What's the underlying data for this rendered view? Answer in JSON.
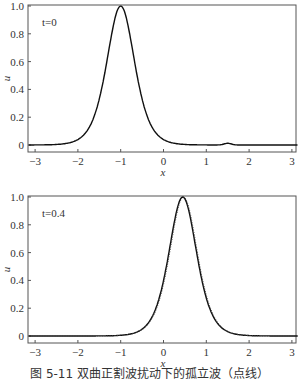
{
  "caption": "图 5-11   双曲正割波扰动下的孤立波（点线）",
  "chart_data": [
    {
      "type": "line",
      "annotation": "t=0",
      "xlabel": "x",
      "ylabel": "u",
      "xlim": [
        -3.15,
        3.15
      ],
      "ylim": [
        -0.03,
        1.0
      ],
      "xticks": [
        "-3",
        "-2",
        "-1",
        "0",
        "1",
        "2",
        "3"
      ],
      "yticks": [
        "0",
        "0.2",
        "0.4",
        "0.6",
        "0.8",
        "1.0"
      ],
      "grid": false,
      "series": [
        {
          "name": "solitary wave",
          "style": "solid",
          "peak_x": -1.0,
          "peak_u": 1.0,
          "x": [
            -3,
            -2.5,
            -2,
            -1.75,
            -1.5,
            -1.25,
            -1,
            -0.75,
            -0.5,
            -0.25,
            0,
            0.5,
            1,
            1.5,
            2,
            3
          ],
          "values": [
            0,
            0.003,
            0.02,
            0.07,
            0.25,
            0.63,
            1.0,
            0.63,
            0.25,
            0.07,
            0.02,
            0.003,
            0,
            0.01,
            0,
            0
          ]
        }
      ]
    },
    {
      "type": "line",
      "annotation": "t=0.4",
      "xlabel": "x",
      "ylabel": "u",
      "xlim": [
        -3.15,
        3.15
      ],
      "ylim": [
        -0.03,
        1.0
      ],
      "xticks": [
        "-3",
        "-2",
        "-1",
        "0",
        "1",
        "2",
        "3"
      ],
      "yticks": [
        "0",
        "0.2",
        "0.4",
        "0.6",
        "0.8",
        "1.0"
      ],
      "grid": false,
      "series": [
        {
          "name": "perturbed solitary wave (dotted)",
          "style": "dotted",
          "peak_x": 0.45,
          "peak_u": 1.0,
          "x": [
            -3,
            -2,
            -1,
            -0.5,
            -0.25,
            0,
            0.2,
            0.45,
            0.7,
            0.95,
            1.2,
            1.5,
            2,
            3
          ],
          "values": [
            0,
            0,
            0.005,
            0.03,
            0.1,
            0.3,
            0.62,
            1.0,
            0.62,
            0.25,
            0.08,
            0.02,
            0,
            0
          ]
        }
      ]
    }
  ]
}
